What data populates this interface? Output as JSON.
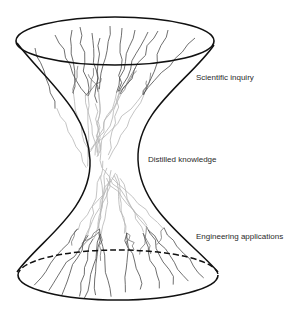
{
  "diagram": {
    "labels": {
      "top": "Scientific inquiry",
      "middle": "Distilled knowledge",
      "bottom": "Engineering applications"
    },
    "colors": {
      "outline": "#111111",
      "branch_dark": "#444444",
      "branch_light": "#bbbbbb",
      "text": "#2a2a2a",
      "background": "#ffffff"
    }
  }
}
